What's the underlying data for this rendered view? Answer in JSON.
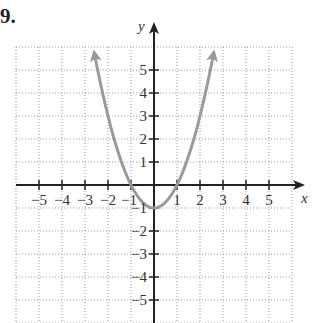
{
  "problem": {
    "number": "9."
  },
  "chart_data": {
    "type": "line",
    "title": "",
    "xlabel": "x",
    "ylabel": "y",
    "xlim": [
      -6,
      6
    ],
    "ylim": [
      -6,
      6
    ],
    "grid": true,
    "x_ticks": [
      -5,
      -4,
      -3,
      -2,
      -1,
      1,
      2,
      3,
      4,
      5
    ],
    "y_ticks": [
      -5,
      -4,
      -3,
      -2,
      -1,
      1,
      2,
      3,
      4,
      5
    ],
    "x_tick_labels": [
      "−5",
      "−4",
      "−3",
      "−2",
      "−1",
      "1",
      "2",
      "3",
      "4",
      "5"
    ],
    "y_tick_labels": [
      "−5",
      "−4",
      "−3",
      "−2",
      "−1",
      "1",
      "2",
      "3",
      "4",
      "5"
    ],
    "series": [
      {
        "name": "y = x^2 - 1",
        "color": "#9a9a9a",
        "x": [
          -2.6,
          -2,
          -1.5,
          -1,
          -0.5,
          0,
          0.5,
          1,
          1.5,
          2,
          2.6
        ],
        "y": [
          5.76,
          3,
          1.25,
          0,
          -0.75,
          -1,
          -0.75,
          0,
          1.25,
          3,
          5.76
        ],
        "arrows": "both ends"
      }
    ],
    "key_points": [
      [
        -1,
        0
      ],
      [
        0,
        -1
      ],
      [
        1,
        0
      ]
    ]
  },
  "colors": {
    "axis": "#222222",
    "grid": "#999999",
    "curve": "#9a9a9a"
  }
}
